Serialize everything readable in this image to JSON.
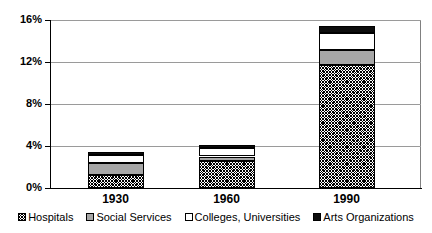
{
  "chart_data": {
    "type": "bar",
    "subtype": "stacked-vertical",
    "title": "",
    "xlabel": "",
    "ylabel": "",
    "categories": [
      "1930",
      "1960",
      "1990"
    ],
    "series": [
      {
        "name": "Hospitals",
        "pattern": "diagonal-crosshatch",
        "values": [
          1.2,
          2.6,
          11.7
        ]
      },
      {
        "name": "Social Services",
        "pattern": "solid-gray",
        "values": [
          1.2,
          0.4,
          1.4
        ]
      },
      {
        "name": "Colleges, Universities",
        "pattern": "solid-white",
        "values": [
          0.75,
          0.8,
          1.7
        ]
      },
      {
        "name": "Arts Organizations",
        "pattern": "solid-black",
        "values": [
          0.25,
          0.3,
          0.6
        ]
      }
    ],
    "stacked_totals": [
      3.4,
      4.1,
      15.4
    ],
    "ylim": [
      0,
      16
    ],
    "ytick_values": [
      0,
      4,
      8,
      12,
      16
    ],
    "ytick_labels": [
      "0%",
      "4%",
      "8%",
      "12%",
      "16%"
    ],
    "grid": true,
    "grid_axis": "y",
    "legend_position": "bottom",
    "value_unit": "%"
  },
  "axes": {
    "y_ticks": [
      {
        "label": "16%",
        "value": 16
      },
      {
        "label": "12%",
        "value": 12
      },
      {
        "label": "8%",
        "value": 8
      },
      {
        "label": "4%",
        "value": 4
      },
      {
        "label": "0%",
        "value": 0
      }
    ],
    "x_ticks": [
      {
        "label": "1930"
      },
      {
        "label": "1960"
      },
      {
        "label": "1990"
      }
    ]
  },
  "legend": {
    "items": [
      {
        "label": "Hospitals",
        "swatch": "hatch"
      },
      {
        "label": "Social Services",
        "swatch": "gray"
      },
      {
        "label": "Colleges, Universities",
        "swatch": "white"
      },
      {
        "label": "Arts Organizations",
        "swatch": "black"
      }
    ]
  },
  "colors": {
    "axis": "#000000",
    "gridline": "#9a9a9a",
    "plot_border": "#808080",
    "background": "#ffffff",
    "social_services": "#a6a6a6",
    "arts_organizations": "#0d0d0d",
    "colleges_universities": "#ffffff"
  }
}
